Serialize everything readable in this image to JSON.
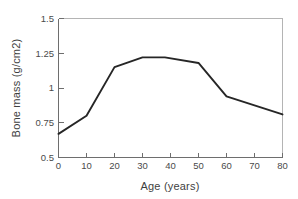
{
  "chart_data": {
    "type": "line",
    "title": "",
    "xlabel": "Age (years)",
    "ylabel": "Bone mass (g/cm2)",
    "xlim": [
      0,
      80
    ],
    "ylim": [
      0.5,
      1.5
    ],
    "xticks": [
      0,
      10,
      20,
      30,
      40,
      50,
      60,
      70,
      80
    ],
    "xtick_labels": [
      "0",
      "10",
      "20",
      "30",
      "40",
      "50",
      "60",
      "70",
      "80"
    ],
    "yticks": [
      0.5,
      0.75,
      1,
      1.25,
      1.5
    ],
    "ytick_labels": [
      "0.5",
      "0.75",
      "1",
      "1.25",
      "1.5"
    ],
    "grid": false,
    "legend": null,
    "series": [
      {
        "name": "Bone mass",
        "color": "#262626",
        "x": [
          0,
          10,
          20,
          30,
          38,
          50,
          60,
          80
        ],
        "values": [
          0.67,
          0.8,
          1.15,
          1.22,
          1.22,
          1.18,
          0.94,
          0.81
        ]
      }
    ]
  },
  "axes": {
    "x_label": "Age (years)",
    "y_label": "Bone mass (g/cm2)"
  }
}
